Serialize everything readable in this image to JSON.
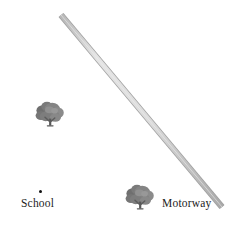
{
  "canvas": {
    "width": 232,
    "height": 233,
    "background_color": "#ffffff"
  },
  "map": {
    "title": "",
    "features": {
      "road": {
        "name": "Motorway",
        "label": "Motorway",
        "type": "motorway-line",
        "fill_color": "#d6d6d6",
        "edge_color": "#9a9a9a",
        "width_px": 5.2,
        "start": {
          "x": 61,
          "y": 15
        },
        "end": {
          "x": 222,
          "y": 207
        },
        "label_position": {
          "x": 162,
          "y": 197
        }
      },
      "school": {
        "name": "School",
        "label": "School",
        "type": "point-marker",
        "marker_color": "#111111",
        "marker_radius_px": 1.7,
        "point": {
          "x": 40.2,
          "y": 191.2
        },
        "label_position": {
          "x": 21,
          "y": 197
        }
      },
      "trees": [
        {
          "name": "tree-upper-left",
          "type": "tree-icon",
          "canopy_color": "#808080",
          "canopy_shadow_color": "#6e6e6e",
          "outline_color": "#5a5a5a",
          "trunk_color": "#4f4f4f",
          "center": {
            "x": 50,
            "y": 114
          },
          "size_px": 30
        },
        {
          "name": "tree-lower-center",
          "type": "tree-icon",
          "canopy_color": "#808080",
          "canopy_shadow_color": "#6e6e6e",
          "outline_color": "#5a5a5a",
          "trunk_color": "#4f4f4f",
          "center": {
            "x": 140,
            "y": 197
          },
          "size_px": 30
        }
      ]
    }
  },
  "labels": {
    "school": "School",
    "motorway": "Motorway"
  },
  "colors": {
    "background": "#ffffff",
    "road_fill": "#d6d6d6",
    "road_edge": "#9a9a9a",
    "tree_gray": "#808080",
    "text": "#1c1c1c",
    "point": "#111111"
  }
}
